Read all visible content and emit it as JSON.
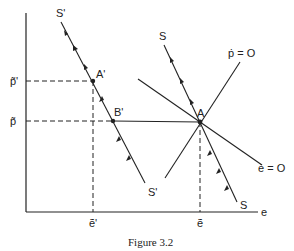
{
  "figure": {
    "caption": "Figure 3.2",
    "axes": {
      "x_label": "e",
      "x_ticks": [
        "ẽ'",
        "ẽ"
      ],
      "y_ticks": [
        "p̃'",
        "p̃"
      ]
    },
    "curves": {
      "saddle_path_new": "S'",
      "saddle_path_new_end": "S'",
      "saddle_path_old": "S",
      "saddle_path_old_end": "S",
      "p_dot_zero": "ṗ = O",
      "e_dot_zero": "ė = O"
    },
    "points": {
      "A": "A",
      "A_prime": "A'",
      "B_prime": "B'"
    },
    "colors": {
      "ink": "#222222",
      "background": "#ffffff"
    }
  }
}
